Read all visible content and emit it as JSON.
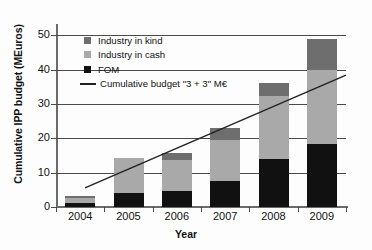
{
  "chart_data": {
    "type": "bar",
    "stacked": true,
    "title": "",
    "xlabel": "Year",
    "ylabel": "Cumulative IPP budget (MEuros)",
    "categories": [
      "2004",
      "2005",
      "2006",
      "2007",
      "2008",
      "2009"
    ],
    "ylim": [
      0,
      53
    ],
    "yticks": [
      0,
      10,
      20,
      30,
      40,
      50
    ],
    "ytick_labels": [
      "0",
      "10",
      "20",
      "30",
      "40",
      "50"
    ],
    "grid": "horizontal",
    "legend_position": "upper-left-inside",
    "series": [
      {
        "name": "FOM",
        "color": "#111111",
        "values": [
          1.2,
          4.1,
          4.7,
          7.6,
          14.1,
          18.3
        ]
      },
      {
        "name": "Industry in cash",
        "color": "#a9a9a9",
        "values": [
          1.4,
          10.2,
          9.1,
          12.0,
          18.2,
          21.7
        ]
      },
      {
        "name": "Industry in kind",
        "color": "#6e6e6e",
        "values": [
          0.7,
          0.0,
          1.8,
          3.3,
          3.8,
          9.0
        ]
      }
    ],
    "totals": [
      3.3,
      14.3,
      15.6,
      22.9,
      36.1,
      49.0
    ],
    "line_series": {
      "name": "Cumulative budget \"3 + 3\" M€",
      "color": "#222222",
      "x": [
        "2004",
        "2009"
      ],
      "start_value": 5.6,
      "end_value": 38.4,
      "x_start_frac": 0.1,
      "x_end_frac": 1.0
    }
  },
  "legend": {
    "items": [
      {
        "label": "Industry in kind",
        "marker": "square",
        "color": "#6e6e6e"
      },
      {
        "label": "Industry in cash",
        "marker": "square",
        "color": "#a9a9a9"
      },
      {
        "label": "FOM",
        "marker": "square",
        "color": "#111111"
      },
      {
        "label": "Cumulative budget \"3 + 3\" M€",
        "marker": "line",
        "color": "#222222"
      }
    ]
  }
}
